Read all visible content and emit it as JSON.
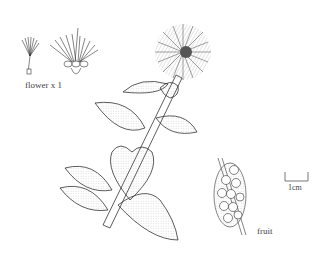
{
  "illustration": {
    "subject": "botanical line drawing: flowering branch with pom-pom flower head, heart-shaped clasping leaves",
    "labels": {
      "flower": "flower x 1",
      "fruit": "fruit",
      "scale": "1cm"
    },
    "colors": {
      "ink": "#333333",
      "background": "#ffffff"
    }
  }
}
